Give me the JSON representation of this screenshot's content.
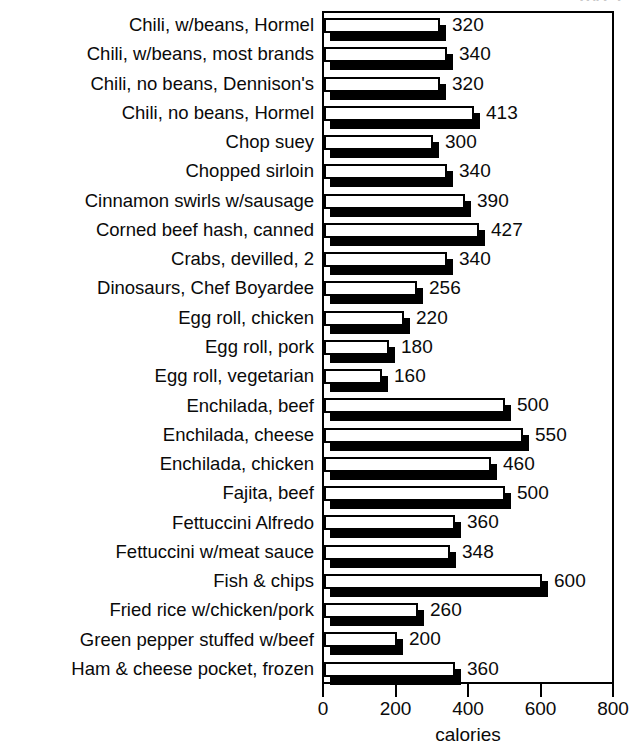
{
  "top_artifact_text": "PAGE",
  "chart_data": {
    "type": "bar",
    "orientation": "horizontal",
    "title": "",
    "xlabel": "calories",
    "ylabel": "",
    "xlim": [
      0,
      800
    ],
    "xticks": [
      0,
      200,
      400,
      600,
      800
    ],
    "xtick_labels": [
      "0",
      "200",
      "400",
      "600",
      "800"
    ],
    "grid": false,
    "legend": null,
    "bar_style": {
      "face_color": "#ffffff",
      "edge_color": "#000000",
      "shadow_color": "#000000",
      "effect": "3d-drop-shadow"
    },
    "categories": [
      "Chili, w/beans, Hormel",
      "Chili, w/beans, most brands",
      "Chili, no beans, Dennison's",
      "Chili, no beans, Hormel",
      "Chop suey",
      "Chopped sirloin",
      "Cinnamon swirls w/sausage",
      "Corned beef hash, canned",
      "Crabs, devilled, 2",
      "Dinosaurs, Chef Boyardee",
      "Egg roll, chicken",
      "Egg roll, pork",
      "Egg roll, vegetarian",
      "Enchilada, beef",
      "Enchilada, cheese",
      "Enchilada, chicken",
      "Fajita, beef",
      "Fettuccini Alfredo",
      "Fettuccini w/meat sauce",
      "Fish & chips",
      "Fried rice w/chicken/pork",
      "Green pepper stuffed w/beef",
      "Ham & cheese pocket, frozen"
    ],
    "values": [
      320,
      340,
      320,
      413,
      300,
      340,
      390,
      427,
      340,
      256,
      220,
      180,
      160,
      500,
      550,
      460,
      500,
      360,
      348,
      600,
      260,
      200,
      360
    ],
    "value_labels": [
      "320",
      "340",
      "320",
      "413",
      "300",
      "340",
      "390",
      "427",
      "340",
      "256",
      "220",
      "180",
      "160",
      "500",
      "550",
      "460",
      "500",
      "360",
      "348",
      "600",
      "260",
      "200",
      "360"
    ]
  }
}
